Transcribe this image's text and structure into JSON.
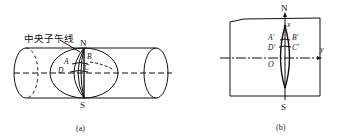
{
  "figure_a": {
    "caption": "(a)",
    "meridian_label": "中央子午线",
    "north": "N",
    "south": "S",
    "points": [
      "A",
      "B",
      "C",
      "D"
    ]
  },
  "figure_b": {
    "caption": "(b)",
    "north": "N",
    "south": "S",
    "x_axis": "x",
    "y_axis": "y",
    "origin": "O",
    "points": [
      "A'",
      "B'",
      "C'",
      "D'"
    ]
  }
}
